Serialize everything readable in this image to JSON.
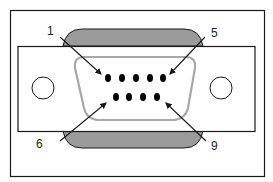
{
  "diagram": {
    "colors": {
      "outline": "#1a1a1a",
      "shell_fill": "#9b9b9b",
      "d_shape_stroke": "#a8a8a8",
      "pin_fill": "#000000",
      "background": "#ffffff"
    },
    "labels": [
      {
        "id": "pin-1",
        "text": "1",
        "x": 50,
        "y": 35
      },
      {
        "id": "pin-5",
        "text": "5",
        "x": 211,
        "y": 37
      },
      {
        "id": "pin-6",
        "text": "6",
        "x": 36,
        "y": 147
      },
      {
        "id": "pin-9",
        "text": "9",
        "x": 211,
        "y": 149
      }
    ],
    "pins_top_row": [
      "1",
      "2",
      "3",
      "4",
      "5"
    ],
    "pins_bottom_row": [
      "6",
      "7",
      "8",
      "9"
    ],
    "mounting_holes": 2
  }
}
